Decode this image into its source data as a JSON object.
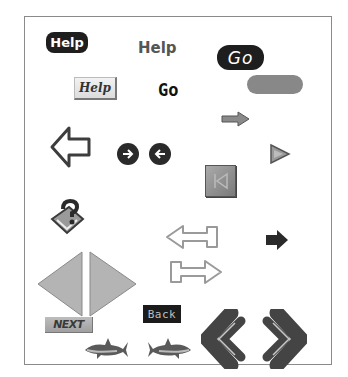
{
  "canvas": {
    "border_color": "#8a8a8a",
    "background": "#ffffff"
  },
  "buttons": {
    "help_dark_pill": {
      "label": "Help",
      "icon": "help-pill"
    },
    "help_plain_text": {
      "label": "Help"
    },
    "go_dark_pill": {
      "label": "Go"
    },
    "help_3d_button": {
      "label": "Help"
    },
    "go_bold_text": {
      "label": "Go"
    },
    "gray_pill": {
      "label": ""
    },
    "next_button": {
      "label": "NEXT"
    },
    "back_button": {
      "label": "Back"
    }
  },
  "icons": [
    {
      "name": "left-outline-arrow-icon",
      "glyph": "⇦"
    },
    {
      "name": "circle-right-arrow-icon",
      "glyph": "➔"
    },
    {
      "name": "circle-left-arrow-icon",
      "glyph": "←"
    },
    {
      "name": "small-right-arrow-icon",
      "glyph": "➡"
    },
    {
      "name": "play-triangle-icon",
      "glyph": "▶"
    },
    {
      "name": "skip-to-start-icon",
      "glyph": "⏮"
    },
    {
      "name": "help-question-book-icon",
      "glyph": "?"
    },
    {
      "name": "large-left-triangle-icon",
      "glyph": "◀"
    },
    {
      "name": "large-right-triangle-icon",
      "glyph": "▶"
    },
    {
      "name": "left-outline-long-arrow-icon",
      "glyph": "⟸"
    },
    {
      "name": "right-outline-long-arrow-icon",
      "glyph": "⟹"
    },
    {
      "name": "dark-right-arrow-icon",
      "glyph": "➡"
    },
    {
      "name": "shark-left-icon",
      "glyph": "🦈"
    },
    {
      "name": "shark-right-icon",
      "glyph": "🦈"
    },
    {
      "name": "double-chevron-left-icon",
      "glyph": "«"
    },
    {
      "name": "double-chevron-right-icon",
      "glyph": "»"
    }
  ],
  "colors": {
    "dark": "#1e1e1e",
    "mid_gray": "#888888",
    "light_gray": "#d8d8d8",
    "outline": "#555555"
  }
}
